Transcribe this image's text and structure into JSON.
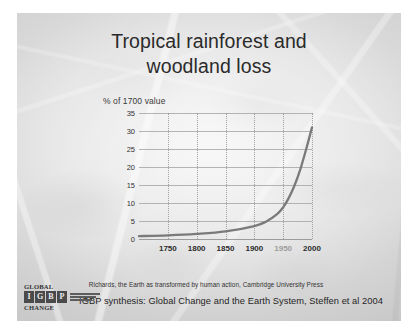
{
  "slide": {
    "title": "Tropical rainforest and\nwoodland loss",
    "source_credit": "Richards, the Earth as transformed by human action, Cambridge University Press",
    "caption": "IGBP synthesis: Global Change and the Earth System, Steffen et al 2004"
  },
  "logo": {
    "top_word": "GLOBAL",
    "bottom_word": "CHANGE",
    "letters": [
      "I",
      "G",
      "B",
      "P"
    ],
    "subtitle": "International Geosphere-Biosphere Programme"
  },
  "colors": {
    "curve": "#7a7a7a",
    "gridline": "#a8a8a8",
    "title_text": "#2b2b2b",
    "slide_background": "#dcdcdc"
  },
  "chart_data": {
    "type": "line",
    "title": "Tropical rainforest and woodland loss",
    "xlabel": "",
    "ylabel": "% of 1700 value",
    "xlim": [
      1700,
      2000
    ],
    "ylim": [
      0,
      35
    ],
    "grid": true,
    "legend": null,
    "xticks": [
      1750,
      1800,
      1850,
      1900,
      1950,
      2000
    ],
    "xtick_labels": [
      "1750",
      "1800",
      "1850",
      "1900",
      "1950",
      "2000"
    ],
    "yticks": [
      0,
      5,
      10,
      15,
      20,
      25,
      30,
      35
    ],
    "ytick_labels": [
      "0",
      "5",
      "10",
      "15",
      "20",
      "25",
      "30",
      "35"
    ],
    "x": [
      1700,
      1750,
      1800,
      1850,
      1900,
      1920,
      1940,
      1950,
      1960,
      1970,
      1980,
      1990,
      2000
    ],
    "values": [
      0.8,
      1.0,
      1.4,
      2.1,
      3.6,
      4.8,
      7.0,
      8.8,
      11.5,
      15.0,
      19.5,
      25.0,
      31.0
    ],
    "series": [
      {
        "name": "Tropical rainforest and woodland loss",
        "values": [
          0.8,
          1.0,
          1.4,
          2.1,
          3.6,
          4.8,
          7.0,
          8.8,
          11.5,
          15.0,
          19.5,
          25.0,
          31.0
        ]
      }
    ]
  }
}
